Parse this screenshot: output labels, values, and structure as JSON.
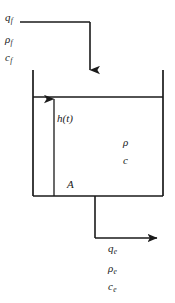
{
  "diagram": {
    "stroke_color": "#1a1a1a",
    "background_color": "#ffffff",
    "labels": {
      "inlet_flow": {
        "symbol": "q",
        "subscript": "f"
      },
      "inlet_density": {
        "symbol": "ρ",
        "subscript": "f"
      },
      "inlet_concentration": {
        "symbol": "c",
        "subscript": "f"
      },
      "liquid_level": {
        "symbol": "h(t)",
        "subscript": ""
      },
      "cross_section_area": {
        "symbol": "A",
        "subscript": ""
      },
      "tank_density": {
        "symbol": "ρ",
        "subscript": ""
      },
      "tank_concentration": {
        "symbol": "c",
        "subscript": ""
      },
      "outlet_flow": {
        "symbol": "q",
        "subscript": "e"
      },
      "outlet_density": {
        "symbol": "ρ",
        "subscript": "e"
      },
      "outlet_concentration": {
        "symbol": "c",
        "subscript": "e"
      }
    },
    "geometry": {
      "tank_left_x": 33,
      "tank_right_x": 163,
      "tank_top_y": 70,
      "tank_bottom_y": 196,
      "liquid_surface_y": 97,
      "inlet_horizontal_y": 22,
      "inlet_start_x": 20,
      "inlet_vertical_x": 90,
      "inlet_arrow_tip_y": 82,
      "level_arrow_x": 54,
      "outlet_vertical_x": 95,
      "outlet_horizontal_y": 238,
      "outlet_arrow_tip_x": 166
    }
  }
}
